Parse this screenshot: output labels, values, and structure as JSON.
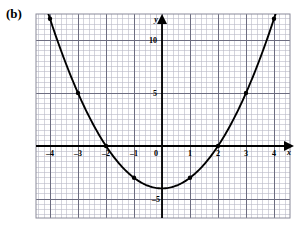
{
  "figure": {
    "panel_label": "(b)",
    "background_color": "#ffffff"
  },
  "chart_data": {
    "type": "line",
    "title": "",
    "subtitle": "",
    "xlabel": "x",
    "ylabel": "y",
    "xlim": [
      -4.5,
      4.5
    ],
    "ylim": [
      -6.5,
      13.0
    ],
    "grid": true,
    "minor_grid": true,
    "legend": null,
    "legend_position": "none",
    "curve_color": "#000000",
    "grid_color": "#b9b9c6",
    "major_grid_color": "#6d6d80",
    "axis_color": "#000000",
    "x_ticks": [
      -4,
      -3,
      -2,
      -1,
      0,
      1,
      2,
      3,
      4
    ],
    "x_tick_labels": [
      "-4",
      "-3",
      "-2",
      "-1",
      "0",
      "1",
      "2",
      "3",
      "4"
    ],
    "y_ticks": [
      5,
      10
    ],
    "y_tick_labels": [
      "5",
      "10"
    ],
    "y_extra_ticks": [
      -5
    ],
    "y_extra_tick_labels": [
      "-5"
    ],
    "function": "y = x^2 - 4",
    "x": [
      -4,
      -3,
      -2,
      -1,
      0,
      1,
      2,
      3,
      4
    ],
    "values": [
      12,
      5,
      0,
      -3,
      -4,
      -3,
      0,
      5,
      12
    ],
    "marked_points": [
      {
        "x": -4,
        "y": 12
      },
      {
        "x": -3,
        "y": 5
      },
      {
        "x": -2,
        "y": 0
      },
      {
        "x": -1,
        "y": -3
      },
      {
        "x": 1,
        "y": -3
      },
      {
        "x": 2,
        "y": 0
      },
      {
        "x": 3,
        "y": 5
      },
      {
        "x": 4,
        "y": 12
      }
    ],
    "series": [
      {
        "name": "y = x^2 - 4",
        "x": [
          -4,
          -3,
          -2,
          -1,
          0,
          1,
          2,
          3,
          4
        ],
        "values": [
          12,
          5,
          0,
          -3,
          -4,
          -3,
          0,
          5,
          12
        ]
      }
    ],
    "annotations": [
      {
        "text": "(b)",
        "position": "top-left"
      }
    ]
  }
}
